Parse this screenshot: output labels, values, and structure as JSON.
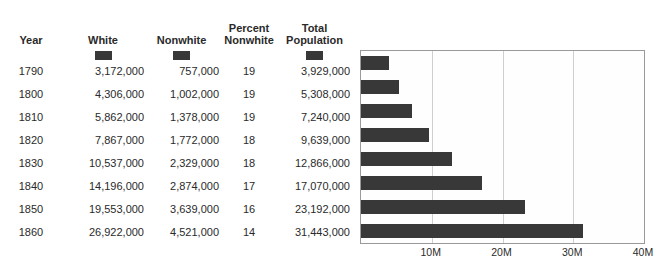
{
  "table": {
    "columns": [
      {
        "label": "Year",
        "swatch": null
      },
      {
        "label": "White",
        "swatch": "#383838"
      },
      {
        "label": "Nonwhite",
        "swatch": "#383838"
      },
      {
        "label": "Percent\nNonwhite",
        "swatch": null
      },
      {
        "label": "Total\nPopulation",
        "swatch": "#383838"
      }
    ],
    "rows": [
      {
        "year": "1790",
        "white": "3,172,000",
        "nonwhite": "757,000",
        "percent_nonwhite": "19",
        "total": "3,929,000"
      },
      {
        "year": "1800",
        "white": "4,306,000",
        "nonwhite": "1,002,000",
        "percent_nonwhite": "19",
        "total": "5,308,000"
      },
      {
        "year": "1810",
        "white": "5,862,000",
        "nonwhite": "1,378,000",
        "percent_nonwhite": "19",
        "total": "7,240,000"
      },
      {
        "year": "1820",
        "white": "7,867,000",
        "nonwhite": "1,772,000",
        "percent_nonwhite": "18",
        "total": "9,639,000"
      },
      {
        "year": "1830",
        "white": "10,537,000",
        "nonwhite": "2,329,000",
        "percent_nonwhite": "18",
        "total": "12,866,000"
      },
      {
        "year": "1840",
        "white": "14,196,000",
        "nonwhite": "2,874,000",
        "percent_nonwhite": "17",
        "total": "17,070,000"
      },
      {
        "year": "1850",
        "white": "19,553,000",
        "nonwhite": "3,639,000",
        "percent_nonwhite": "16",
        "total": "23,192,000"
      },
      {
        "year": "1860",
        "white": "26,922,000",
        "nonwhite": "4,521,000",
        "percent_nonwhite": "14",
        "total": "31,443,000"
      }
    ]
  },
  "chart_data": {
    "type": "bar",
    "orientation": "horizontal",
    "title": "",
    "xlabel": "",
    "ylabel": "",
    "categories": [
      "1790",
      "1800",
      "1810",
      "1820",
      "1830",
      "1840",
      "1850",
      "1860"
    ],
    "values": [
      3929000,
      5308000,
      7240000,
      9639000,
      12866000,
      17070000,
      23192000,
      31443000
    ],
    "series": [
      {
        "name": "Total Population",
        "color": "#383838",
        "values": [
          3929000,
          5308000,
          7240000,
          9639000,
          12866000,
          17070000,
          23192000,
          31443000
        ]
      }
    ],
    "xlim": [
      0,
      40000000
    ],
    "ticks": [
      {
        "value": 10000000,
        "label": "10M"
      },
      {
        "value": 20000000,
        "label": "20M"
      },
      {
        "value": 30000000,
        "label": "30M"
      },
      {
        "value": 40000000,
        "label": "40M"
      }
    ],
    "grid": true,
    "legend": "none"
  },
  "colors": {
    "bar": "#383838",
    "gridline": "#cfcfcf",
    "plot_border": "#9a9a9a",
    "plot_background": "#fefefe",
    "text": "#2b2b2b"
  }
}
